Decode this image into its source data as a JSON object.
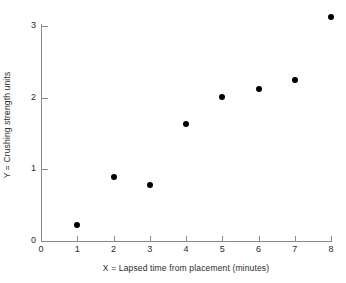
{
  "chart_data": {
    "type": "scatter",
    "title": "",
    "xlabel": "X = Lapsed time from placement (minutes)",
    "ylabel": "Y = Crushing strength units",
    "xlim": [
      0,
      8
    ],
    "ylim": [
      0,
      3.2
    ],
    "xticks": [
      0,
      1,
      2,
      3,
      4,
      5,
      6,
      7,
      8
    ],
    "xticklabels": [
      "0",
      "1",
      "2",
      "3",
      "4",
      "5",
      "6",
      "7",
      "8"
    ],
    "yticks": [
      0,
      1,
      2,
      3
    ],
    "yticklabels": [
      "0",
      "1",
      "2",
      "3"
    ],
    "grid": false,
    "legend": null,
    "marker": {
      "shape": "circle",
      "color": "#000000",
      "size_px": 6
    },
    "axis_color": "#8a8a8a",
    "background": "#ffffff",
    "x": [
      1,
      2,
      3,
      4,
      5,
      6,
      7,
      8
    ],
    "y": [
      0.22,
      0.89,
      0.78,
      1.63,
      2.01,
      2.12,
      2.25,
      3.13
    ],
    "points": [
      {
        "x": 1,
        "y": 0.22
      },
      {
        "x": 2,
        "y": 0.89
      },
      {
        "x": 3,
        "y": 0.78
      },
      {
        "x": 4,
        "y": 1.63
      },
      {
        "x": 5,
        "y": 2.01
      },
      {
        "x": 6,
        "y": 2.12
      },
      {
        "x": 7,
        "y": 2.25
      },
      {
        "x": 8,
        "y": 3.13
      }
    ]
  }
}
